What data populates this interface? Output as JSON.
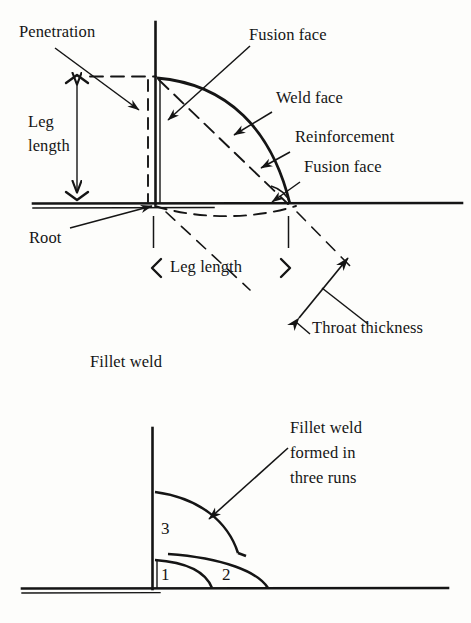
{
  "figure": {
    "background_color": "#fdfdfb",
    "ink_color": "#151515"
  },
  "top_diagram": {
    "caption": "Fillet weld",
    "labels": {
      "penetration": "Penetration",
      "leg_length_vertical": "Leg\nlength",
      "leg_length_vertical_line1": "Leg",
      "leg_length_vertical_line2": "length",
      "fusion_face_top": "Fusion face",
      "weld_face": "Weld face",
      "reinforcement": "Reinforcement",
      "fusion_face_bottom": "Fusion face",
      "root": "Root",
      "leg_length_horizontal": "Leg length",
      "throat_thickness": "Throat thickness"
    }
  },
  "bottom_diagram": {
    "annotation_line1": "Fillet weld",
    "annotation_line2": "formed in",
    "annotation_line3": "three runs",
    "run_labels": [
      "1",
      "2",
      "3"
    ],
    "run_1": "1",
    "run_2": "2",
    "run_3": "3"
  }
}
